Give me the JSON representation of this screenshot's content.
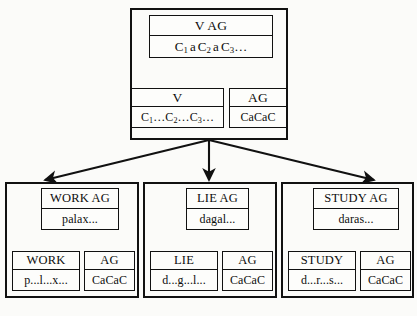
{
  "diagram": {
    "type": "tree-of-feature-structures",
    "title": "",
    "colors": {
      "background": "#fbfbf9",
      "border": "#111111",
      "text": "#0d0d0d",
      "arrow": "#111111"
    },
    "levels": [
      {
        "id": "root-group",
        "nodes": [
          {
            "id": "root-result",
            "head": "V AG",
            "value": "C1 a C2 a C3 ...",
            "value_parts": [
              "C",
              "1",
              " a ",
              "C",
              "2",
              " a ",
              "C",
              "3",
              "..."
            ]
          },
          {
            "id": "root-left-child",
            "head": "V",
            "value": "C1...C2...C3...",
            "value_parts": [
              "C",
              "1",
              "...",
              "C",
              "2",
              "...",
              "C",
              "3",
              "..."
            ]
          },
          {
            "id": "root-right-child",
            "head": "AG",
            "value": "CaCaC"
          }
        ]
      }
    ],
    "leaf_groups": [
      {
        "id": "work-group",
        "result": {
          "head": "WORK AG",
          "value": "palax..."
        },
        "left": {
          "head": "WORK",
          "value": "p...l...x..."
        },
        "right": {
          "head": "AG",
          "value": "CaCaC"
        }
      },
      {
        "id": "lie-group",
        "result": {
          "head": "LIE AG",
          "value": "dagal..."
        },
        "left": {
          "head": "LIE",
          "value": "d...g...l..."
        },
        "right": {
          "head": "AG",
          "value": "CaCaC"
        }
      },
      {
        "id": "study-group",
        "result": {
          "head": "STUDY AG",
          "value": "daras..."
        },
        "left": {
          "head": "STUDY",
          "value": "d...r...s..."
        },
        "right": {
          "head": "AG",
          "value": "CaCaC"
        }
      }
    ],
    "arrow_count_internal": 2,
    "arrow_count_fanout": 3
  }
}
